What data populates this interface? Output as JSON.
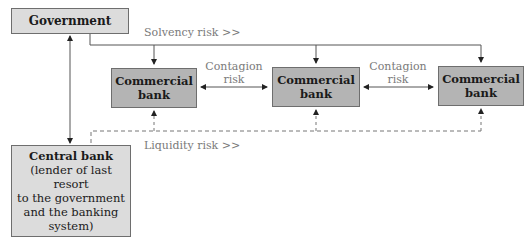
{
  "diagram": {
    "nodes": {
      "government": "Government",
      "central_bank_title": "Central bank",
      "central_bank_desc": [
        "(lender of last resort",
        "to the government",
        "and the banking",
        "system)"
      ],
      "commercial_banks": [
        {
          "line1": "Commercial",
          "line2": "bank"
        },
        {
          "line1": "Commercial",
          "line2": "bank"
        },
        {
          "line1": "Commercial",
          "line2": "bank"
        }
      ]
    },
    "labels": {
      "solvency": "Solvency risk >>",
      "liquidity": "Liquidity risk >>",
      "contagion_1": [
        "Contagion",
        "risk"
      ],
      "contagion_2": [
        "Contagion",
        "risk"
      ]
    },
    "colors": {
      "government_fill": "#dcdcdc",
      "central_bank_fill": "#dcdcdc",
      "commercial_bank_fill": "#b4b4b4",
      "line": "#555555",
      "label": "#7a7a7a"
    }
  }
}
